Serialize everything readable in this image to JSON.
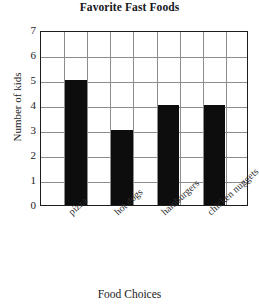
{
  "chart_data": {
    "type": "bar",
    "title": "Favorite Fast Foods",
    "xlabel": "Food Choices",
    "ylabel": "Number of kids",
    "categories": [
      "pizza",
      "hot dogs",
      "hamburgers",
      "chicken nuggets"
    ],
    "values": [
      5,
      3,
      4,
      4
    ],
    "ylim": [
      0,
      7
    ],
    "ytick_labels": [
      "7",
      "6",
      "5",
      "4",
      "3",
      "2",
      "1",
      "0"
    ],
    "ytick_values": [
      7,
      6,
      5,
      4,
      3,
      2,
      1,
      0
    ],
    "grid": true,
    "grid_columns": 9,
    "grid_rows": 7,
    "legend": "none",
    "bar_color": "#0d0d0d",
    "grid_color": "#8d8d8d",
    "axis_color": "#1d1d1d",
    "background_color": "#ffffff",
    "bar_columns": [
      2,
      4,
      6,
      8
    ]
  }
}
